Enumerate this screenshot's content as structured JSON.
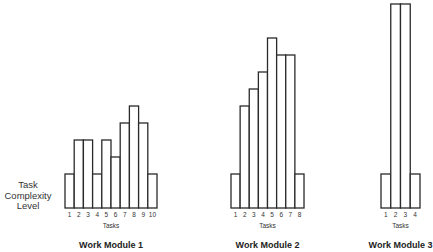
{
  "chart_data": {
    "type": "bar",
    "ylabel": "Task Complexity Level",
    "ylabel_lines": [
      "Task",
      "Complexity",
      "Level"
    ],
    "grid": false,
    "charts": [
      {
        "title": "Work Module 1",
        "xlabel": "Tasks",
        "categories": [
          "1",
          "2",
          "3",
          "4",
          "5",
          "6",
          "7",
          "8",
          "9",
          "10"
        ],
        "values": [
          1,
          2,
          2,
          1,
          2,
          1.5,
          2.5,
          3,
          2.5,
          1
        ],
        "x_start": 65,
        "x_end": 157
      },
      {
        "title": "Work Module 2",
        "xlabel": "Tasks",
        "categories": [
          "1",
          "2",
          "3",
          "4",
          "5",
          "6",
          "7",
          "8"
        ],
        "values": [
          1,
          3,
          3.5,
          4,
          5,
          4.5,
          4.5,
          1
        ],
        "x_start": 231,
        "x_end": 304
      },
      {
        "title": "Work Module 3",
        "xlabel": "Tasks",
        "categories": [
          "1",
          "2",
          "3",
          "4"
        ],
        "values": [
          1,
          6,
          6,
          1
        ],
        "x_start": 381,
        "x_end": 420
      }
    ],
    "layout": {
      "baseline_y": 208,
      "unit_px": 34
    }
  }
}
